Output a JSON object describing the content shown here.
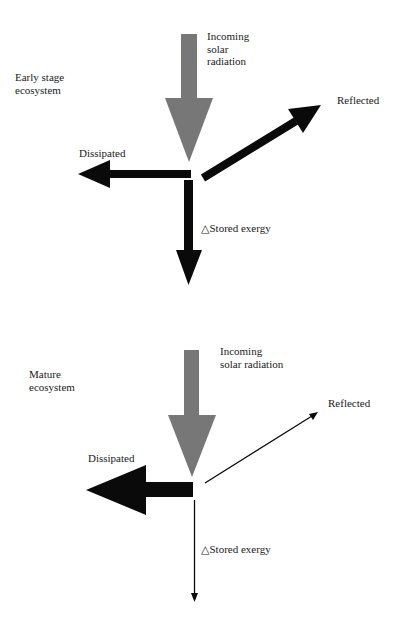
{
  "colors": {
    "incoming": "#777777",
    "output": "#0a0a0a",
    "background": "#ffffff"
  },
  "panels": [
    {
      "title": "Early stage\necosystem",
      "incoming_label": "Incoming\nsolar\nradiation",
      "reflected_label": "Reflected",
      "dissipated_label": "Dissipated",
      "stored_label": "△Stored exergy",
      "relative_widths": {
        "reflected": "thick",
        "dissipated": "medium",
        "stored": "medium"
      }
    },
    {
      "title": "Mature\necosystem",
      "incoming_label": "Incoming\nsolar radiation",
      "reflected_label": "Reflected",
      "dissipated_label": "Dissipated",
      "stored_label": "△Stored exergy",
      "relative_widths": {
        "reflected": "thin",
        "dissipated": "thick",
        "stored": "thin"
      }
    }
  ]
}
